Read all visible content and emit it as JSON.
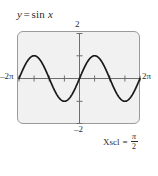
{
  "figure": {
    "title": {
      "lhs": "y",
      "equals": "=",
      "rhs_fn": "sin",
      "rhs_var": "x",
      "full": "y = sin x"
    },
    "annotation": {
      "lead": "Xscl",
      "equals": "=",
      "numerator": "π",
      "denominator": "2",
      "full": "Xscl = π/2"
    },
    "axis_labels": {
      "x_min": "–2π",
      "x_max": "2π",
      "y_max": "2",
      "y_min": "–2"
    },
    "colors": {
      "screen_background": "#f1f1f1",
      "screen_border": "#9a9a9a",
      "curve": "#1a1a1a",
      "axis": "#6e6e6e",
      "text": "#2b2b2b",
      "page_background": "#ffffff"
    }
  },
  "chart_data": {
    "type": "line",
    "xlabel": "",
    "ylabel": "",
    "legend": [],
    "grid": false,
    "annotations": [
      "Xscl = π/2"
    ],
    "xlim": [
      -6.283185307,
      6.283185307
    ],
    "ylim": [
      -2,
      2
    ],
    "xticks": [
      -6.283185307,
      -4.71238898,
      -3.141592654,
      -1.570796327,
      0,
      1.570796327,
      3.141592654,
      4.71238898,
      6.283185307
    ],
    "xticklabels": [
      "–2π",
      "",
      "",
      "",
      "",
      "",
      "",
      "",
      "2π"
    ],
    "yticks": [
      -2,
      -1,
      0,
      1,
      2
    ],
    "yticklabels": [
      "–2",
      "",
      "",
      "",
      "2"
    ],
    "xscl": 1.570796327,
    "yscl": 1,
    "series": [
      {
        "name": "sin x",
        "function": "y = sin(x)",
        "amplitude": 1,
        "period": 6.283185307,
        "x": [
          -6.283185307,
          -5.890486225,
          -5.497787144,
          -5.105088062,
          -4.71238898,
          -4.319689899,
          -3.926990817,
          -3.534291735,
          -3.141592654,
          -2.748893572,
          -2.35619449,
          -1.963495408,
          -1.570796327,
          -1.178097245,
          -0.785398163,
          -0.392699082,
          0,
          0.392699082,
          0.785398163,
          1.178097245,
          1.570796327,
          1.963495408,
          2.35619449,
          2.748893572,
          3.141592654,
          3.534291735,
          3.926990817,
          4.319689899,
          4.71238898,
          5.105088062,
          5.497787144,
          5.890486225,
          6.283185307
        ],
        "y": [
          0,
          0.382683432,
          0.707106781,
          0.923879533,
          1,
          0.923879533,
          0.707106781,
          0.382683432,
          0,
          -0.382683432,
          -0.707106781,
          -0.923879533,
          -1,
          -0.923879533,
          -0.707106781,
          -0.382683432,
          0,
          0.382683432,
          0.707106781,
          0.923879533,
          1,
          0.923879533,
          0.707106781,
          0.382683432,
          0,
          -0.382683432,
          -0.707106781,
          -0.923879533,
          -1,
          -0.923879533,
          -0.707106781,
          -0.382683432,
          0
        ]
      }
    ]
  }
}
